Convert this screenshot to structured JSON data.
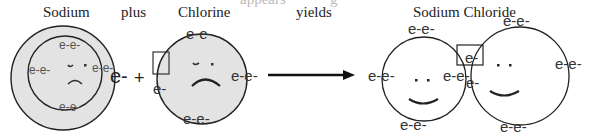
{
  "title_fragment": "appears",
  "title_fragment_2": "g",
  "labels": {
    "sodium": "Sodium",
    "plus": "plus",
    "chlorine": "Chlorine",
    "yields": "yields",
    "sodium_chloride": "Sodium Chloride"
  },
  "operators": {
    "plus_sign": "+"
  },
  "electrons": {
    "pair": "e-e-",
    "single": "e-"
  },
  "colors": {
    "atom_fill": "#e3e3e3",
    "stroke": "#222222",
    "background": "#ffffff"
  }
}
